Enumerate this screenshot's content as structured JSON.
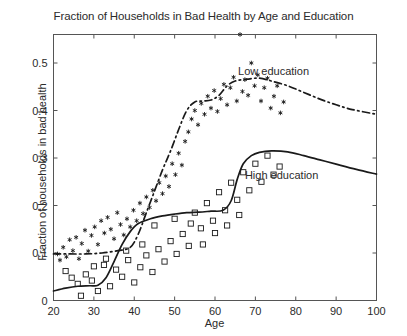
{
  "chart_data": {
    "type": "scatter",
    "title": "Fraction of Households in Bad Health by Age and Education",
    "xlabel": "Age",
    "ylabel": "Fraction of households in bad health",
    "xlim": [
      20,
      100
    ],
    "ylim": [
      0,
      0.56
    ],
    "xticks": [
      20,
      30,
      40,
      50,
      60,
      70,
      80,
      90,
      100
    ],
    "xticklabels": [
      "20",
      "30",
      "40",
      "50",
      "60",
      "70",
      "80",
      "90",
      "100"
    ],
    "yticks": [
      0,
      0.1,
      0.2,
      0.3,
      0.4,
      0.5
    ],
    "yticklabels": [
      "0",
      "0.1",
      "0.2",
      "0.3",
      "0.4",
      "0.5"
    ],
    "grid": false,
    "legend_position": "inline-annotations",
    "annotations": [
      {
        "text": "Low education",
        "x": 74.5,
        "y": 0.475
      },
      {
        "text": "High education",
        "x": 76.5,
        "y": 0.255
      }
    ],
    "series": [
      {
        "name": "Low education",
        "marker": "asterisk",
        "color": "#1a1a1a",
        "points": [
          [
            21.0,
            0.098
          ],
          [
            21.6,
            0.085
          ],
          [
            22.4,
            0.112
          ],
          [
            23.2,
            0.092
          ],
          [
            24.0,
            0.128
          ],
          [
            24.8,
            0.105
          ],
          [
            25.6,
            0.133
          ],
          [
            26.3,
            0.088
          ],
          [
            27.0,
            0.12
          ],
          [
            27.8,
            0.148
          ],
          [
            28.6,
            0.104
          ],
          [
            29.4,
            0.137
          ],
          [
            30.2,
            0.155
          ],
          [
            31.0,
            0.118
          ],
          [
            31.8,
            0.168
          ],
          [
            32.6,
            0.142
          ],
          [
            33.4,
            0.175
          ],
          [
            34.2,
            0.15
          ],
          [
            35.0,
            0.13
          ],
          [
            35.8,
            0.185
          ],
          [
            36.6,
            0.16
          ],
          [
            37.4,
            0.138
          ],
          [
            38.2,
            0.172
          ],
          [
            39.0,
            0.155
          ],
          [
            39.8,
            0.19
          ],
          [
            40.6,
            0.168
          ],
          [
            41.4,
            0.205
          ],
          [
            42.2,
            0.183
          ],
          [
            43.0,
            0.218
          ],
          [
            43.8,
            0.196
          ],
          [
            44.6,
            0.232
          ],
          [
            45.4,
            0.21
          ],
          [
            46.2,
            0.248
          ],
          [
            47.0,
            0.225
          ],
          [
            47.8,
            0.262
          ],
          [
            48.6,
            0.24
          ],
          [
            49.4,
            0.288
          ],
          [
            50.2,
            0.265
          ],
          [
            51.0,
            0.31
          ],
          [
            51.8,
            0.285
          ],
          [
            52.6,
            0.335
          ],
          [
            53.4,
            0.355
          ],
          [
            54.2,
            0.382
          ],
          [
            55.0,
            0.4
          ],
          [
            55.8,
            0.37
          ],
          [
            56.6,
            0.415
          ],
          [
            57.4,
            0.392
          ],
          [
            58.2,
            0.43
          ],
          [
            59.0,
            0.405
          ],
          [
            59.8,
            0.442
          ],
          [
            60.6,
            0.398
          ],
          [
            61.4,
            0.425
          ],
          [
            62.2,
            0.455
          ],
          [
            63.0,
            0.412
          ],
          [
            63.8,
            0.448
          ],
          [
            64.6,
            0.47
          ],
          [
            65.4,
            0.42
          ],
          [
            66.2,
            0.56
          ],
          [
            66.8,
            0.44
          ],
          [
            67.4,
            0.465
          ],
          [
            68.2,
            0.432
          ],
          [
            69.0,
            0.5
          ],
          [
            69.8,
            0.452
          ],
          [
            70.6,
            0.475
          ],
          [
            71.4,
            0.42
          ],
          [
            72.2,
            0.448
          ],
          [
            73.0,
            0.468
          ],
          [
            73.8,
            0.405
          ],
          [
            74.6,
            0.43
          ],
          [
            75.4,
            0.452
          ],
          [
            76.2,
            0.395
          ],
          [
            77.0,
            0.418
          ]
        ]
      },
      {
        "name": "High education",
        "marker": "square",
        "color": "#1a1a1a",
        "points": [
          [
            23.0,
            0.062
          ],
          [
            24.5,
            0.048
          ],
          [
            26.0,
            0.035
          ],
          [
            26.8,
            0.01
          ],
          [
            28.0,
            0.055
          ],
          [
            29.5,
            0.042
          ],
          [
            31.0,
            0.02
          ],
          [
            32.5,
            0.075
          ],
          [
            34.0,
            0.03
          ],
          [
            35.5,
            0.065
          ],
          [
            37.0,
            0.05
          ],
          [
            38.5,
            0.085
          ],
          [
            40.0,
            0.038
          ],
          [
            41.5,
            0.07
          ],
          [
            43.0,
            0.095
          ],
          [
            44.5,
            0.06
          ],
          [
            46.0,
            0.108
          ],
          [
            47.5,
            0.082
          ],
          [
            49.0,
            0.125
          ],
          [
            50.5,
            0.098
          ],
          [
            52.0,
            0.14
          ],
          [
            53.5,
            0.115
          ],
          [
            55.0,
            0.185
          ],
          [
            56.5,
            0.152
          ],
          [
            58.0,
            0.205
          ],
          [
            59.5,
            0.168
          ],
          [
            61.0,
            0.228
          ],
          [
            62.5,
            0.19
          ],
          [
            64.0,
            0.248
          ],
          [
            65.5,
            0.212
          ],
          [
            67.0,
            0.27
          ],
          [
            68.5,
            0.232
          ],
          [
            70.0,
            0.288
          ],
          [
            71.5,
            0.25
          ],
          [
            73.0,
            0.305
          ],
          [
            74.5,
            0.265
          ],
          [
            76.0,
            0.282
          ],
          [
            45.0,
            0.158
          ],
          [
            50.0,
            0.172
          ],
          [
            54.0,
            0.162
          ],
          [
            57.0,
            0.118
          ],
          [
            60.0,
            0.142
          ],
          [
            63.0,
            0.158
          ],
          [
            66.0,
            0.18
          ],
          [
            42.0,
            0.118
          ],
          [
            38.0,
            0.105
          ],
          [
            33.0,
            0.088
          ],
          [
            30.0,
            0.072
          ]
        ]
      }
    ],
    "fitted_curves": [
      {
        "name": "Low education",
        "linestyle": "dash-dot",
        "color": "#1a1a1a",
        "points": [
          [
            20,
            0.098
          ],
          [
            24,
            0.098
          ],
          [
            28,
            0.098
          ],
          [
            32,
            0.1
          ],
          [
            36,
            0.105
          ],
          [
            39,
            0.112
          ],
          [
            41,
            0.14
          ],
          [
            43,
            0.185
          ],
          [
            45,
            0.23
          ],
          [
            47,
            0.275
          ],
          [
            49,
            0.315
          ],
          [
            51,
            0.36
          ],
          [
            53,
            0.4
          ],
          [
            55,
            0.418
          ],
          [
            57,
            0.42
          ],
          [
            59,
            0.422
          ],
          [
            61,
            0.432
          ],
          [
            63,
            0.452
          ],
          [
            65,
            0.462
          ],
          [
            68,
            0.466
          ],
          [
            71,
            0.468
          ],
          [
            74,
            0.462
          ],
          [
            78,
            0.452
          ],
          [
            82,
            0.438
          ],
          [
            86,
            0.424
          ],
          [
            90,
            0.412
          ],
          [
            94,
            0.402
          ],
          [
            100,
            0.392
          ]
        ]
      },
      {
        "name": "High education",
        "linestyle": "solid",
        "color": "#1a1a1a",
        "points": [
          [
            20,
            0.02
          ],
          [
            23,
            0.026
          ],
          [
            26,
            0.03
          ],
          [
            29,
            0.031
          ],
          [
            31,
            0.032
          ],
          [
            33,
            0.048
          ],
          [
            35,
            0.082
          ],
          [
            37,
            0.118
          ],
          [
            39,
            0.145
          ],
          [
            41,
            0.162
          ],
          [
            44,
            0.172
          ],
          [
            47,
            0.178
          ],
          [
            50,
            0.182
          ],
          [
            53,
            0.185
          ],
          [
            56,
            0.186
          ],
          [
            59,
            0.188
          ],
          [
            62,
            0.19
          ],
          [
            64,
            0.21
          ],
          [
            65.5,
            0.255
          ],
          [
            67,
            0.288
          ],
          [
            69,
            0.305
          ],
          [
            71,
            0.312
          ],
          [
            74,
            0.315
          ],
          [
            78,
            0.313
          ],
          [
            82,
            0.305
          ],
          [
            86,
            0.296
          ],
          [
            90,
            0.287
          ],
          [
            95,
            0.276
          ],
          [
            100,
            0.266
          ]
        ]
      }
    ]
  }
}
